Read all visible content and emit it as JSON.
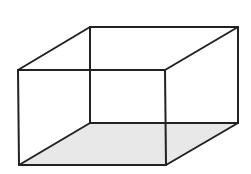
{
  "diagram": {
    "type": "wireframe-box",
    "colors": {
      "background": "#ffffff",
      "stroke": "#222222",
      "bottom_face_fill": "#e8e8e8"
    },
    "vertices": {
      "front_top_left": [
        18,
        70
      ],
      "front_top_right": [
        165,
        70
      ],
      "front_bottom_left": [
        19,
        165
      ],
      "front_bottom_right": [
        166,
        165
      ],
      "back_top_left": [
        90,
        27
      ],
      "back_top_right": [
        238,
        27
      ],
      "back_bottom_left": [
        90,
        123
      ],
      "back_bottom_right": [
        238,
        123
      ]
    }
  }
}
